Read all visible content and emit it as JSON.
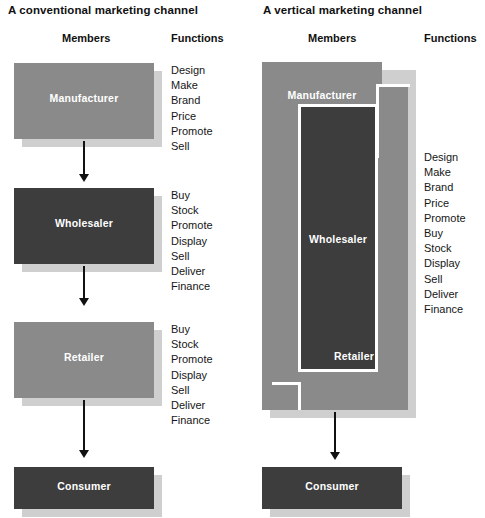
{
  "figure": {
    "type": "diagram"
  },
  "panels": {
    "left": {
      "title": "A conventional marketing channel",
      "headers": {
        "members": "Members",
        "functions": "Functions"
      },
      "members": [
        {
          "label": "Manufacturer",
          "color": "#8a8a8a"
        },
        {
          "label": "Wholesaler",
          "color": "#3d3d3d"
        },
        {
          "label": "Retailer",
          "color": "#8a8a8a"
        },
        {
          "label": "Consumer",
          "color": "#3d3d3d"
        }
      ],
      "function_groups": [
        {
          "for": "Manufacturer",
          "items": [
            "Design",
            "Make",
            "Brand",
            "Price",
            "Promote",
            "Sell"
          ]
        },
        {
          "for": "Wholesaler",
          "items": [
            "Buy",
            "Stock",
            "Promote",
            "Display",
            "Sell",
            "Deliver",
            "Finance"
          ]
        },
        {
          "for": "Retailer",
          "items": [
            "Buy",
            "Stock",
            "Promote",
            "Display",
            "Sell",
            "Deliver",
            "Finance"
          ]
        }
      ]
    },
    "right": {
      "title": "A vertical marketing channel",
      "headers": {
        "members": "Members",
        "functions": "Functions"
      },
      "members": [
        {
          "label": "Manufacturer",
          "color": "#8a8a8a"
        },
        {
          "label": "Wholesaler",
          "color": "#3d3d3d"
        },
        {
          "label": "Retailer",
          "color": "#8a8a8a"
        },
        {
          "label": "Consumer",
          "color": "#3d3d3d"
        }
      ],
      "functions": [
        "Design",
        "Make",
        "Brand",
        "Price",
        "Promote",
        "Buy",
        "Stock",
        "Display",
        "Sell",
        "Deliver",
        "Finance"
      ]
    }
  },
  "colors": {
    "member_gray": "#8a8a8a",
    "member_dark": "#3d3d3d",
    "shadow": "#cfcfcf",
    "text_dark": "#111111",
    "text_light": "#ffffff",
    "background": "#ffffff"
  }
}
